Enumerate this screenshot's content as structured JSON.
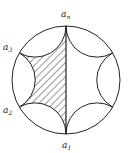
{
  "diagram": {
    "type": "ideal-hyperbolic-polygon-in-disk",
    "colors": {
      "stroke": "#222222",
      "background": "#ffffff",
      "hatch": "#222222"
    },
    "disk": {
      "cx": 66,
      "cy": 80,
      "r": 54
    },
    "labels": [
      {
        "id": "a_n",
        "base": "a",
        "sub": "n",
        "x": 61,
        "y": 17
      },
      {
        "id": "a_3",
        "base": "a",
        "sub": "3",
        "x": 3,
        "y": 50
      },
      {
        "id": "a_2",
        "base": "a",
        "sub": "2",
        "x": 3,
        "y": 113
      },
      {
        "id": "a_1",
        "base": "a",
        "sub": "1",
        "x": 62,
        "y": 148
      }
    ],
    "shaded_region": "left half bounded by a_n, a_3, a_2, a_1"
  }
}
